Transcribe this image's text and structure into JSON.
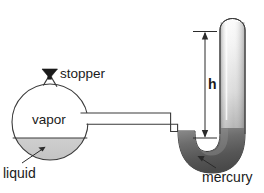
{
  "diagram": {
    "labels": {
      "stopper": "stopper",
      "vapor": "vapor",
      "liquid": "liquid",
      "mercury": "mercury",
      "height": "h"
    },
    "colors": {
      "outline": "#3a3a3a",
      "liquid_fill": "#c9c9c9",
      "mercury_dark": "#5a5a5a",
      "mercury_light": "#9e9e9e",
      "glass_light": "#fbfbfb",
      "stopper_fill": "#1a1a1a",
      "text": "#1a1a1a",
      "background": "#ffffff"
    },
    "parts": {
      "flask": "round-bottom-flask",
      "stopper": "stopper-plug",
      "connector": "horizontal-glass-tube",
      "manometer": "u-shaped-mercury-tube",
      "dimension": "height-dimension-arrow"
    }
  }
}
